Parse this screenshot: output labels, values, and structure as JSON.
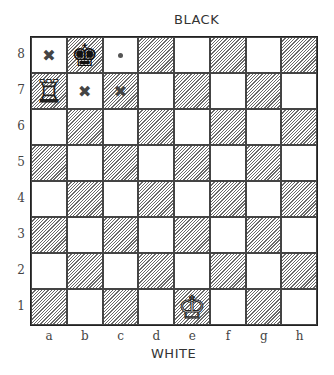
{
  "labels": {
    "top": "BLACK",
    "bottom": "WHITE"
  },
  "ranks": [
    "8",
    "7",
    "6",
    "5",
    "4",
    "3",
    "2",
    "1"
  ],
  "files": [
    "a",
    "b",
    "c",
    "d",
    "e",
    "f",
    "g",
    "h"
  ],
  "pieces": [
    {
      "square": "b8",
      "type": "king",
      "color": "black",
      "glyph": "♚"
    },
    {
      "square": "a7",
      "type": "rook",
      "color": "white",
      "glyph": "♖"
    },
    {
      "square": "e1",
      "type": "king",
      "color": "white",
      "glyph": "♔"
    }
  ],
  "markers": [
    {
      "square": "a8",
      "kind": "cross",
      "glyph": "✖"
    },
    {
      "square": "b7",
      "kind": "cross",
      "glyph": "✖"
    },
    {
      "square": "c7",
      "kind": "cross",
      "glyph": "✖"
    },
    {
      "square": "c8",
      "kind": "dot"
    }
  ],
  "colors": {
    "border": "#222222",
    "hatch": "#6a6a6a",
    "light": "#ffffff",
    "text": "#333333"
  }
}
